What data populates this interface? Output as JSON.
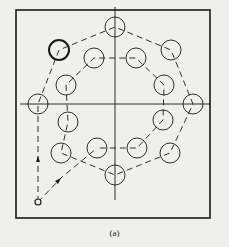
{
  "caption": "(a)",
  "colors": {
    "background": "#efefeb",
    "stroke": "#1a1a1a"
  },
  "frame": {
    "x": 16,
    "y": 10,
    "w": 194,
    "h": 208
  },
  "axes": {
    "vertical": {
      "x": 115,
      "y1": 7,
      "y2": 200
    },
    "horizontal": {
      "y": 104,
      "x1": 20,
      "x2": 211
    }
  },
  "hole_radius": 10,
  "start_point": {
    "x": 38,
    "y": 202
  },
  "outer_holes": [
    {
      "x": 38,
      "y": 104
    },
    {
      "x": 59,
      "y": 50,
      "emphasized": true
    },
    {
      "x": 115,
      "y": 27
    },
    {
      "x": 171,
      "y": 50
    },
    {
      "x": 193,
      "y": 104
    },
    {
      "x": 170,
      "y": 153
    },
    {
      "x": 115,
      "y": 175
    }
  ],
  "inner_holes": [
    {
      "x": 61,
      "y": 153
    },
    {
      "x": 68,
      "y": 122
    },
    {
      "x": 66,
      "y": 85
    },
    {
      "x": 94,
      "y": 58
    },
    {
      "x": 136,
      "y": 58
    },
    {
      "x": 164,
      "y": 85
    },
    {
      "x": 163,
      "y": 120
    },
    {
      "x": 137,
      "y": 148
    },
    {
      "x": 97,
      "y": 148
    }
  ],
  "paths": [
    [
      [
        38,
        202
      ],
      [
        38,
        104
      ],
      [
        59,
        50
      ],
      [
        115,
        27
      ],
      [
        171,
        50
      ],
      [
        193,
        104
      ],
      [
        170,
        153
      ],
      [
        115,
        175
      ],
      [
        61,
        153
      ],
      [
        68,
        122
      ],
      [
        66,
        85
      ],
      [
        94,
        58
      ],
      [
        136,
        58
      ],
      [
        164,
        85
      ],
      [
        163,
        120
      ],
      [
        137,
        148
      ],
      [
        97,
        148
      ]
    ],
    [
      [
        38,
        202
      ],
      [
        61,
        178
      ],
      [
        97,
        148
      ]
    ]
  ],
  "arrows": [
    {
      "x": 38,
      "y": 160,
      "dir": "up"
    },
    {
      "x": 58,
      "y": 181,
      "dir": "up-right"
    }
  ]
}
